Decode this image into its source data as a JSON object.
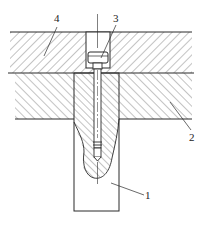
{
  "diagram": {
    "type": "mechanical-section-drawing",
    "callouts": [
      {
        "id": "1",
        "label": "1",
        "x": 147,
        "y": 199
      },
      {
        "id": "2",
        "label": "2",
        "x": 193,
        "y": 141
      },
      {
        "id": "3",
        "label": "3",
        "x": 118,
        "y": 22
      },
      {
        "id": "4",
        "label": "4",
        "x": 54,
        "y": 22
      }
    ],
    "colors": {
      "line": "#2a2a2a",
      "hatch": "#6a6a6a",
      "background": "#ffffff"
    }
  }
}
